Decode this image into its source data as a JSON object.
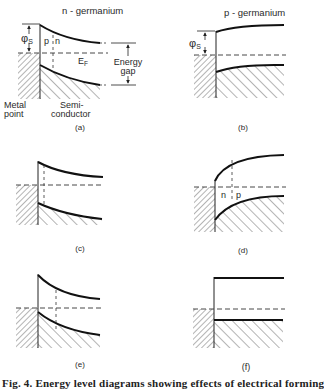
{
  "figure": {
    "caption": "Fig. 4. Energy level diagrams showing effects of electrical forming",
    "panels": [
      {
        "id": "a",
        "label": "(a)",
        "title": "n - germanium",
        "band_bending": "up (depletion)",
        "labels": {
          "phi": "φ",
          "phi_sub": "S",
          "p_region": "p",
          "n_region": "n",
          "fermi": "E",
          "fermi_sub": "F",
          "energy_gap_line1": "Energy",
          "energy_gap_line2": "gap",
          "metal_line1": "Metal",
          "metal_line2": "point",
          "semi_line1": "Semi-",
          "semi_line2": "conductor"
        }
      },
      {
        "id": "b",
        "label": "(b)",
        "title": "p - germanium",
        "band_bending": "down (accumulation)",
        "labels": {
          "phi": "φ",
          "phi_sub": "S"
        }
      },
      {
        "id": "c",
        "label": "(c)",
        "band_bending": "up, shallow inversion layer"
      },
      {
        "id": "d",
        "label": "(d)",
        "band_bending": "down, n-region near contact",
        "labels": {
          "n_region": "n",
          "p_region": "p"
        }
      },
      {
        "id": "e",
        "label": "(e)",
        "band_bending": "up, deeper inversion layer"
      },
      {
        "id": "f",
        "label": "(f)",
        "band_bending": "flat bands"
      }
    ]
  }
}
